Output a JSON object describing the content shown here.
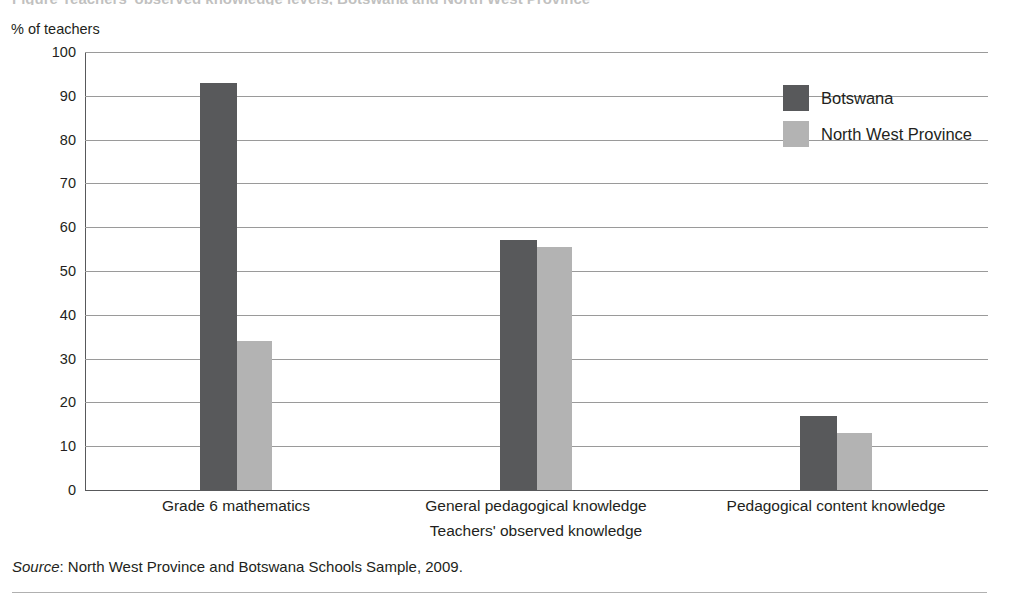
{
  "figure": {
    "title": "Figure  Teachers' observed knowledge levels, Botswana and North West Province",
    "y_axis_caption": "% of teachers",
    "x_axis_title": "Teachers' observed knowledge",
    "source_prefix": "Source",
    "source_text": ": North West Province and Botswana Schools Sample, 2009."
  },
  "colors": {
    "series_botswana": "#58595b",
    "series_north_west": "#b3b3b3",
    "gridline": "#9a9a9a",
    "axis": "#58595b",
    "text": "#231f20"
  },
  "chart_data": {
    "type": "bar",
    "title": "Teachers' observed knowledge levels, Botswana and North West Province",
    "xlabel": "Teachers' observed knowledge",
    "ylabel": "% of teachers",
    "ylim": [
      0,
      100
    ],
    "ytick_step": 10,
    "yticks": [
      100,
      90,
      80,
      70,
      60,
      50,
      40,
      30,
      20,
      10,
      0
    ],
    "grid": true,
    "legend_position": "top-right",
    "categories": [
      "Grade 6 mathematics",
      "General pedagogical knowledge",
      "Pedagogical content knowledge"
    ],
    "series": [
      {
        "name": "Botswana",
        "values": [
          93,
          57,
          17
        ]
      },
      {
        "name": "North West Province",
        "values": [
          34,
          55.5,
          13
        ]
      }
    ]
  }
}
